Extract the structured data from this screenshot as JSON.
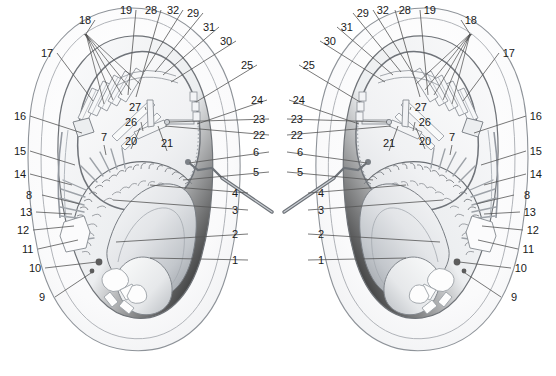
{
  "figure": {
    "panel_count": 2,
    "panels": [
      {
        "id": "left-panel",
        "name": "left-specimen",
        "orientation": "normal"
      },
      {
        "id": "right-panel",
        "name": "right-specimen",
        "orientation": "mirrored"
      }
    ],
    "background_color": "#ffffff",
    "line_color": "#4a4a4a",
    "leader_color": "#555555",
    "label_color": "#1a1a1a",
    "fill_light": "#f4f5f7",
    "fill_mid": "#dfe1e4",
    "fill_dark": "#9ea3a9",
    "dot_color": "#5d5d5d"
  },
  "caption": {
    "text": ""
  },
  "labels": {
    "left": [
      {
        "n": "1",
        "x": 232,
        "y": 264,
        "anchor": "start",
        "tip_x": 150,
        "tip_y": 258
      },
      {
        "n": "2",
        "x": 232,
        "y": 238,
        "anchor": "start",
        "tip_x": 116,
        "tip_y": 242
      },
      {
        "n": "3",
        "x": 232,
        "y": 214,
        "anchor": "start",
        "tip_x": 113,
        "tip_y": 200
      },
      {
        "n": "4",
        "x": 232,
        "y": 197,
        "anchor": "start",
        "tip_x": 150,
        "tip_y": 185
      },
      {
        "n": "5",
        "x": 253,
        "y": 176,
        "anchor": "start",
        "tip_x": 183,
        "tip_y": 180
      },
      {
        "n": "6",
        "x": 253,
        "y": 156,
        "anchor": "start",
        "tip_x": 189,
        "tip_y": 163
      },
      {
        "n": "22",
        "x": 253,
        "y": 139,
        "anchor": "start",
        "tip_x": 165,
        "tip_y": 126
      },
      {
        "n": "23",
        "x": 253,
        "y": 123,
        "anchor": "start",
        "tip_x": 169,
        "tip_y": 122
      },
      {
        "n": "24",
        "x": 251,
        "y": 104,
        "anchor": "start",
        "tip_x": 197,
        "tip_y": 124
      },
      {
        "n": "25",
        "x": 241,
        "y": 69,
        "anchor": "start",
        "tip_x": 196,
        "tip_y": 102
      },
      {
        "n": "30",
        "x": 220,
        "y": 45,
        "anchor": "start",
        "tip_x": 171,
        "tip_y": 82
      },
      {
        "n": "31",
        "x": 203,
        "y": 31,
        "anchor": "start",
        "tip_x": 163,
        "tip_y": 75
      },
      {
        "n": "29",
        "x": 187,
        "y": 17,
        "anchor": "start",
        "tip_x": 155,
        "tip_y": 72
      },
      {
        "n": "32",
        "x": 167,
        "y": 14,
        "anchor": "start",
        "tip_x": 144,
        "tip_y": 72
      },
      {
        "n": "28",
        "x": 145,
        "y": 14,
        "anchor": "start",
        "tip_x": 136,
        "tip_y": 97
      },
      {
        "n": "19",
        "x": 120,
        "y": 14,
        "anchor": "start",
        "tip_x": 128,
        "tip_y": 95
      },
      {
        "n": "18",
        "x": 79,
        "y": 24,
        "anchor": "start",
        "tip_x": 86,
        "tip_y": 34
      },
      {
        "n": "17",
        "x": 41,
        "y": 57,
        "anchor": "start",
        "tip_x": 93,
        "tip_y": 101
      },
      {
        "n": "16",
        "x": 14,
        "y": 120,
        "anchor": "start",
        "tip_x": 82,
        "tip_y": 133
      },
      {
        "n": "15",
        "x": 14,
        "y": 155,
        "anchor": "start",
        "tip_x": 75,
        "tip_y": 165
      },
      {
        "n": "14",
        "x": 14,
        "y": 178,
        "anchor": "start",
        "tip_x": 72,
        "tip_y": 185
      },
      {
        "n": "8",
        "x": 26,
        "y": 199,
        "anchor": "start",
        "tip_x": 80,
        "tip_y": 204
      },
      {
        "n": "13",
        "x": 20,
        "y": 216,
        "anchor": "start",
        "tip_x": 72,
        "tip_y": 214
      },
      {
        "n": "12",
        "x": 17,
        "y": 234,
        "anchor": "start",
        "tip_x": 74,
        "tip_y": 226
      },
      {
        "n": "11",
        "x": 22,
        "y": 253,
        "anchor": "start",
        "tip_x": 78,
        "tip_y": 240
      },
      {
        "n": "10",
        "x": 29,
        "y": 272,
        "anchor": "start",
        "tip_x": 97,
        "tip_y": 262
      },
      {
        "n": "9",
        "x": 39,
        "y": 301,
        "anchor": "start",
        "tip_x": 94,
        "tip_y": 271
      },
      {
        "n": "7",
        "x": 104,
        "y": 141,
        "anchor": "middle",
        "tip_x": 106,
        "tip_y": 155
      },
      {
        "n": "20",
        "x": 131,
        "y": 145,
        "anchor": "middle",
        "tip_x": 140,
        "tip_y": 128
      },
      {
        "n": "21",
        "x": 167,
        "y": 147,
        "anchor": "middle",
        "tip_x": 158,
        "tip_y": 126
      },
      {
        "n": "26",
        "x": 125,
        "y": 126,
        "anchor": "start",
        "tip_x": 143,
        "tip_y": 131
      },
      {
        "n": "27",
        "x": 129,
        "y": 111,
        "anchor": "start",
        "tip_x": 146,
        "tip_y": 110
      }
    ]
  },
  "label_numbers": [
    "1",
    "2",
    "3",
    "4",
    "5",
    "6",
    "7",
    "8",
    "9",
    "10",
    "11",
    "12",
    "13",
    "14",
    "15",
    "16",
    "17",
    "18",
    "19",
    "20",
    "21",
    "22",
    "23",
    "24",
    "25",
    "26",
    "27",
    "28",
    "29",
    "30",
    "31",
    "32"
  ],
  "fan_label": {
    "number": "18",
    "tip_x": 86,
    "tip_y": 34,
    "ends": [
      {
        "x": 104,
        "y": 104
      },
      {
        "x": 113,
        "y": 100
      },
      {
        "x": 122,
        "y": 95
      },
      {
        "x": 131,
        "y": 90
      },
      {
        "x": 140,
        "y": 84
      }
    ]
  }
}
